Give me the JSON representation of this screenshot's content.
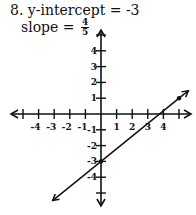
{
  "problem": {
    "number_label": "8. y-intercept = -3",
    "slope_label": "slope =",
    "slope_numerator": "4",
    "slope_denominator": "5"
  },
  "chart_data": {
    "type": "line",
    "xlabel": "",
    "ylabel": "",
    "xlim": [
      -5,
      5
    ],
    "ylim": [
      -5,
      5
    ],
    "grid": false,
    "x_tick_labels": [
      "-4",
      "-3",
      "-2",
      "-1",
      "1",
      "2",
      "3",
      "4"
    ],
    "y_tick_labels": [
      "4",
      "3",
      "2",
      "1",
      "-1",
      "-2",
      "-3",
      "-4"
    ],
    "series": [
      {
        "name": "y = (4/5)x - 3",
        "slope": 0.8,
        "intercept": -3,
        "points": [
          {
            "x": 0,
            "y": -3
          },
          {
            "x": 5,
            "y": 1
          }
        ],
        "arrows_both_ends": true
      }
    ]
  }
}
